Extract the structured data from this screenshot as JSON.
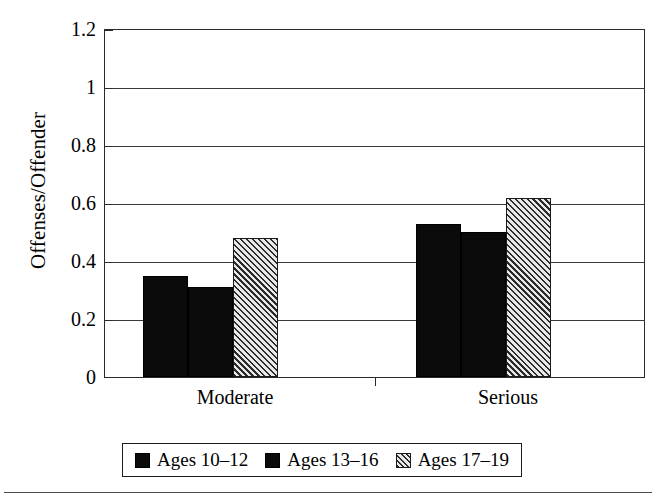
{
  "chart_data": {
    "type": "bar",
    "title": "",
    "xlabel": "",
    "ylabel": "Offenses/Offender",
    "categories": [
      "Moderate",
      "Serious"
    ],
    "series": [
      {
        "name": "Ages 10–12",
        "values": [
          0.35,
          0.53
        ],
        "fill": "solid-black",
        "color": "#0b0b0b"
      },
      {
        "name": "Ages 13–16",
        "values": [
          0.31,
          0.5
        ],
        "fill": "solid-black",
        "color": "#0b0b0b"
      },
      {
        "name": "Ages 17–19",
        "values": [
          0.48,
          0.62
        ],
        "fill": "diagonal-hatch",
        "color": "#b9b9b9"
      }
    ],
    "ylim": [
      0,
      1.2
    ],
    "ytick_labels": [
      "0",
      "0.2",
      "0.4",
      "0.6",
      "0.8",
      "1",
      "1.2"
    ],
    "ytick_values": [
      0,
      0.2,
      0.4,
      0.6,
      0.8,
      1,
      1.2
    ],
    "grid": "horizontal",
    "legend_position": "bottom"
  },
  "axis": {
    "y_title": "Offenses/Offender",
    "ticks": [
      {
        "label": "1.2",
        "value": 1.2
      },
      {
        "label": "1",
        "value": 1.0
      },
      {
        "label": "0.8",
        "value": 0.8
      },
      {
        "label": "0.6",
        "value": 0.6
      },
      {
        "label": "0.4",
        "value": 0.4
      },
      {
        "label": "0.2",
        "value": 0.2
      },
      {
        "label": "0",
        "value": 0
      }
    ],
    "categories": [
      {
        "label": "Moderate"
      },
      {
        "label": "Serious"
      }
    ]
  },
  "legend": {
    "items": [
      {
        "label": "Ages 10–12",
        "swatch": "solid-black-swatch"
      },
      {
        "label": "Ages 13–16",
        "swatch": "solid-black-swatch"
      },
      {
        "label": "Ages 17–19",
        "swatch": "hatched-swatch"
      }
    ]
  }
}
